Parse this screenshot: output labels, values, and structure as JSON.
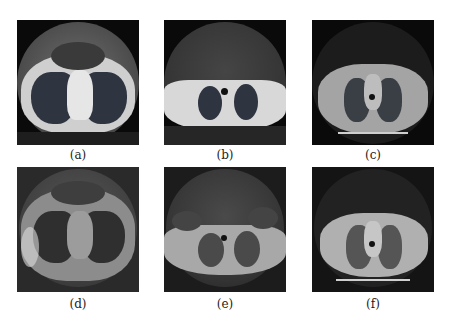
{
  "figure": {
    "panels": [
      {
        "id": "a",
        "label": "(a)",
        "description": "CT chest slice, lung window, high quality reference"
      },
      {
        "id": "b",
        "label": "(b)",
        "description": "CT upper chest slice, lung window, high quality reference"
      },
      {
        "id": "c",
        "label": "(c)",
        "description": "CT chest slice with soft tissue, high quality reference"
      },
      {
        "id": "d",
        "label": "(d)",
        "description": "Degraded reconstruction of (a) with blur and artifacts"
      },
      {
        "id": "e",
        "label": "(e)",
        "description": "Degraded reconstruction of (b) with blur and artifacts"
      },
      {
        "id": "f",
        "label": "(f)",
        "description": "Degraded reconstruction of (c) with blur and artifacts"
      }
    ]
  }
}
